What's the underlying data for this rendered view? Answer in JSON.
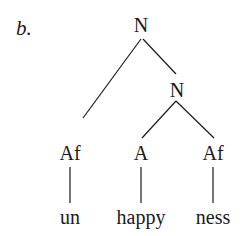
{
  "example_label": "b.",
  "tree": {
    "root": "N",
    "inner": "N",
    "leaves": [
      {
        "category": "Af",
        "morpheme": "un"
      },
      {
        "category": "A",
        "morpheme": "happy"
      },
      {
        "category": "Af",
        "morpheme": "ness"
      }
    ]
  }
}
